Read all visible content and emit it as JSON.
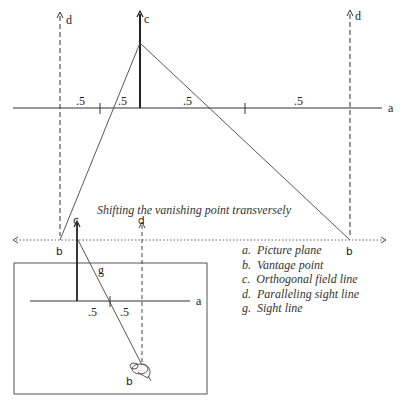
{
  "top_diagram": {
    "caption": "Shifting the vanishing point transversely",
    "labels": {
      "a": "a",
      "b_left": "b",
      "b_right": "b",
      "c": "c",
      "d_left": "d",
      "d_right": "d"
    },
    "segments": [
      ".5",
      ".5",
      ".5",
      ".5"
    ]
  },
  "inset_diagram": {
    "labels": {
      "a": "a",
      "b": "b",
      "c": "c",
      "d": "d",
      "g": "g"
    },
    "segments": [
      ".5",
      ".5"
    ]
  },
  "legend": {
    "items": [
      {
        "key": "a.",
        "text": "Picture plane"
      },
      {
        "key": "b.",
        "text": "Vantage point"
      },
      {
        "key": "c.",
        "text": "Orthogonal field line"
      },
      {
        "key": "d.",
        "text": "Paralleling sight line"
      },
      {
        "key": "g.",
        "text": "Sight line"
      }
    ]
  }
}
